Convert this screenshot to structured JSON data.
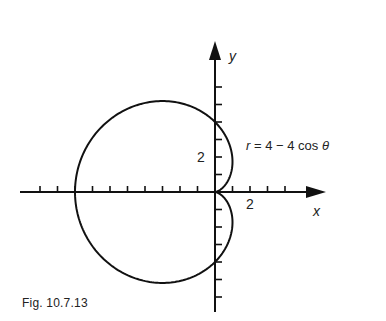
{
  "figure": {
    "caption": "Fig. 10.7.13",
    "equation": {
      "lhs": "r",
      "rhs": "= 4 − 4 cos ",
      "theta": "θ"
    },
    "axis_labels": {
      "x": "x",
      "y": "y"
    },
    "tick_labels": {
      "x_2": "2",
      "y_2": "2"
    },
    "colors": {
      "ink": "#111111",
      "background": "#ffffff"
    }
  },
  "chart_data": {
    "type": "line",
    "title": "",
    "equation": "r = 4 - 4 cos θ",
    "curve": "cardioid",
    "xlabel": "x",
    "ylabel": "y",
    "xlim": [
      -9,
      2
    ],
    "ylim": [
      -5.5,
      5.5
    ],
    "tick_spacing": 1,
    "labeled_ticks": {
      "x": [
        2
      ],
      "y": [
        2
      ]
    },
    "key_points": [
      {
        "x": 0,
        "y": 0,
        "note": "cusp at origin (θ = 0)"
      },
      {
        "x": 0,
        "y": 4,
        "note": "θ = π/2"
      },
      {
        "x": -8,
        "y": 0,
        "note": "θ = π"
      },
      {
        "x": 0,
        "y": -4,
        "note": "θ = 3π/2"
      }
    ],
    "grid": false,
    "legend": null
  }
}
